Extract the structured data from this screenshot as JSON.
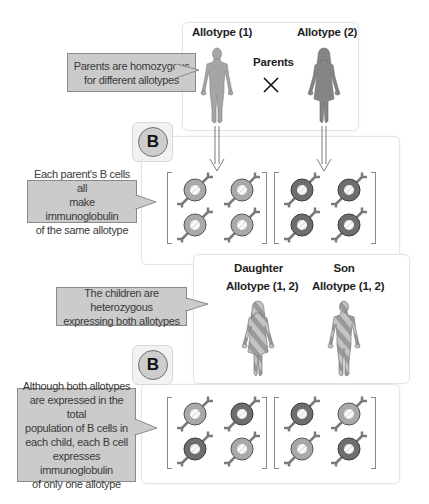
{
  "parents": {
    "title": "Parents",
    "father_label": "Allotype (1)",
    "mother_label": "Allotype (2)",
    "cross_symbol": "×"
  },
  "callouts": {
    "parents": "Parents are homozygous\nfor different allotypes",
    "parent_bcells": "Each parent's B cells all\nmake immunoglobulin\nof the same allotype",
    "children": "The children are heterozygous\nexpressing both allotypes",
    "children_bcells": "Although both allotypes\nare expressed in the total\npopulation of B cells in\neach child, each  B cell\nexpresses immunoglobulin\nof only one allotype"
  },
  "badges": {
    "top": "B",
    "bottom": "B"
  },
  "children": {
    "daughter_title": "Daughter",
    "daughter_label": "Allotype (1, 2)",
    "son_title": "Son",
    "son_label": "Allotype (1, 2)"
  },
  "cell_groups": {
    "parent_left": [
      "allotype-1",
      "allotype-1",
      "allotype-1",
      "allotype-1"
    ],
    "parent_right": [
      "allotype-2",
      "allotype-2",
      "allotype-2",
      "allotype-2"
    ],
    "child_left": [
      "allotype-1",
      "allotype-2",
      "allotype-2",
      "allotype-1"
    ],
    "child_right": [
      "allotype-2",
      "allotype-1",
      "allotype-1",
      "allotype-2"
    ]
  },
  "colors": {
    "allotype_1": "#a9a9a9",
    "allotype_2": "#6e6e6e",
    "callout_bg": "#cbcbcb",
    "badge_circle": "#cdcdcd"
  }
}
